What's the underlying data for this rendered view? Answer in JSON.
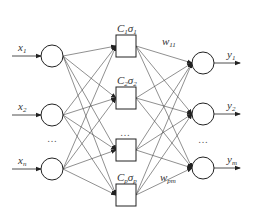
{
  "diagram": {
    "type": "neural-network",
    "layers": {
      "input": {
        "nodes": [
          {
            "label": "x",
            "sub": "1",
            "y": 56
          },
          {
            "label": "x",
            "sub": "2",
            "y": 115
          },
          {
            "label": "x",
            "sub": "n",
            "y": 169
          }
        ],
        "ellipsis": "…",
        "ellipsis_y": 142
      },
      "hidden": {
        "nodes": [
          {
            "label": "C",
            "sub": "1",
            "sigma": "σ",
            "sigma_sub": "1",
            "y": 46
          },
          {
            "label": "C",
            "sub": "2",
            "sigma": "σ",
            "sigma_sub": "2",
            "y": 98
          },
          {
            "label": "",
            "sub": "",
            "sigma": "",
            "sigma_sub": "",
            "y": 150,
            "ellipsis": "…"
          },
          {
            "label": "C",
            "sub": "p",
            "sigma": "σ",
            "sigma_sub": "p",
            "y": 195
          }
        ]
      },
      "output": {
        "nodes": [
          {
            "label": "y",
            "sub": "1",
            "y": 63
          },
          {
            "label": "y",
            "sub": "2",
            "y": 114
          },
          {
            "label": "y",
            "sub": "m",
            "y": 168
          }
        ],
        "ellipsis": "…",
        "ellipsis_y": 143
      }
    },
    "weights": [
      {
        "label": "w",
        "sub": "11"
      },
      {
        "label": "w",
        "sub": "pm"
      }
    ]
  }
}
